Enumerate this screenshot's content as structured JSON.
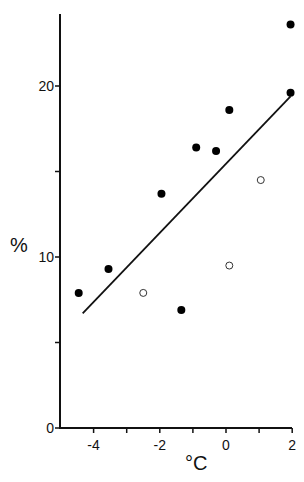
{
  "chart_data": {
    "type": "scatter",
    "title": "",
    "xlabel": "°C",
    "ylabel": "%",
    "xlim": [
      -5,
      2
    ],
    "ylim": [
      0,
      24.5
    ],
    "x_ticks": [
      -4,
      -3,
      -2,
      -1,
      0,
      1,
      2
    ],
    "x_tick_labels": [
      "-4",
      "-2",
      "0",
      "2"
    ],
    "y_ticks": [
      0,
      5,
      10,
      15,
      20
    ],
    "y_tick_labels": [
      "0",
      "10",
      "20"
    ],
    "grid": false,
    "series": [
      {
        "name": "filled",
        "marker": "filled-circle",
        "points": [
          [
            -4.45,
            7.9
          ],
          [
            -3.55,
            9.3
          ],
          [
            -1.95,
            13.7
          ],
          [
            -0.9,
            16.4
          ],
          [
            -0.3,
            16.2
          ],
          [
            0.1,
            18.6
          ],
          [
            1.95,
            23.6
          ],
          [
            1.95,
            19.6
          ],
          [
            -1.35,
            6.9
          ]
        ]
      },
      {
        "name": "open",
        "marker": "open-circle",
        "points": [
          [
            -2.5,
            7.9
          ],
          [
            0.1,
            9.5
          ],
          [
            1.05,
            14.5
          ]
        ]
      }
    ],
    "regression_line": {
      "x1": -4.33,
      "y1": 6.7,
      "x2": 1.95,
      "y2": 19.4
    }
  }
}
